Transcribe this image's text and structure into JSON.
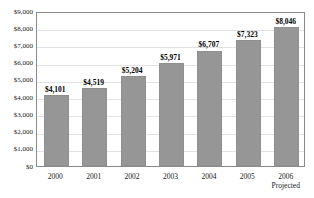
{
  "chart_data": {
    "type": "bar",
    "title": "",
    "subtitle": "",
    "xlabel": "",
    "ylabel": "",
    "categories": [
      "2000",
      "2001",
      "2002",
      "2003",
      "2004",
      "2005",
      "2006"
    ],
    "category_sublabels": [
      "",
      "",
      "",
      "",
      "",
      "",
      "Projected"
    ],
    "values": [
      4101,
      4519,
      5204,
      5971,
      6707,
      7323,
      8046
    ],
    "data_labels": [
      "$4,101",
      "$4,519",
      "$5,204",
      "$5,971",
      "$6,707",
      "$7,323",
      "$8,046"
    ],
    "ylim": [
      0,
      9000
    ],
    "ytick_values": [
      9000,
      8000,
      7000,
      6000,
      5000,
      4000,
      3000,
      2000,
      1000,
      0
    ],
    "ytick_labels": [
      "$9,000",
      "$8,000",
      "$7,000",
      "$6,000",
      "$5,000",
      "$4,000",
      "$3,000",
      "$2,000",
      "$1,000",
      "$0"
    ],
    "grid": true,
    "legend": false,
    "legend_position": "none",
    "bar_color": "#969696",
    "grid_color": "#e2e2e2",
    "frame_color": "#8a8a8a",
    "text_color": "#1a1a1a"
  }
}
